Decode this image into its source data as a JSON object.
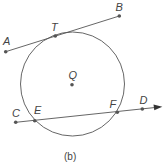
{
  "figure": {
    "caption": "(b)",
    "colors": {
      "stroke": "#555555",
      "point": "#555555",
      "text": "#444444"
    },
    "circle": {
      "center_label": "Q",
      "cx": 72.5,
      "cy": 84,
      "r": 52
    },
    "points": [
      {
        "label": "A",
        "x": 5.7,
        "y": 51.7,
        "lx": 3,
        "ly": 45
      },
      {
        "label": "B",
        "x": 119.3,
        "y": 16,
        "lx": 115.5,
        "ly": 11
      },
      {
        "label": "T",
        "x": 55.3,
        "y": 36,
        "lx": 51,
        "ly": 31
      },
      {
        "label": "Q",
        "x": 72,
        "y": 84.7,
        "lx": 68.5,
        "ly": 79
      },
      {
        "label": "C",
        "x": 15.7,
        "y": 122.3,
        "lx": 12,
        "ly": 117
      },
      {
        "label": "E",
        "x": 34.7,
        "y": 120.7,
        "lx": 34,
        "ly": 114
      },
      {
        "label": "F",
        "x": 117.3,
        "y": 112.3,
        "lx": 109.5,
        "ly": 108
      },
      {
        "label": "D",
        "x": 142.3,
        "y": 109,
        "lx": 139.5,
        "ly": 104
      }
    ],
    "tangent_line": {
      "from": "A",
      "to": "B",
      "through": "T"
    },
    "secant_ray": {
      "from": "C",
      "through": [
        "E",
        "F",
        "D"
      ],
      "arrow_tip": {
        "x": 162.3,
        "y": 106.7
      }
    }
  }
}
